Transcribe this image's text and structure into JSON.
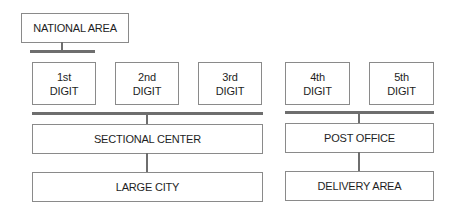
{
  "diagram": {
    "type": "hierarchy",
    "top": {
      "label": "NATIONAL AREA"
    },
    "digits": [
      {
        "label": "1st\nDIGIT"
      },
      {
        "label": "2nd\nDIGIT"
      },
      {
        "label": "3rd\nDIGIT"
      },
      {
        "label": "4th\nDIGIT"
      },
      {
        "label": "5th\nDIGIT"
      }
    ],
    "left_group": {
      "level1": {
        "label": "SECTIONAL CENTER"
      },
      "level2": {
        "label": "LARGE CITY"
      }
    },
    "right_group": {
      "level1": {
        "label": "POST OFFICE"
      },
      "level2": {
        "label": "DELIVERY AREA"
      }
    },
    "colors": {
      "box_border": "#8a8a8a",
      "connector": "#6e6e6e",
      "text": "#1e1e1e"
    }
  }
}
